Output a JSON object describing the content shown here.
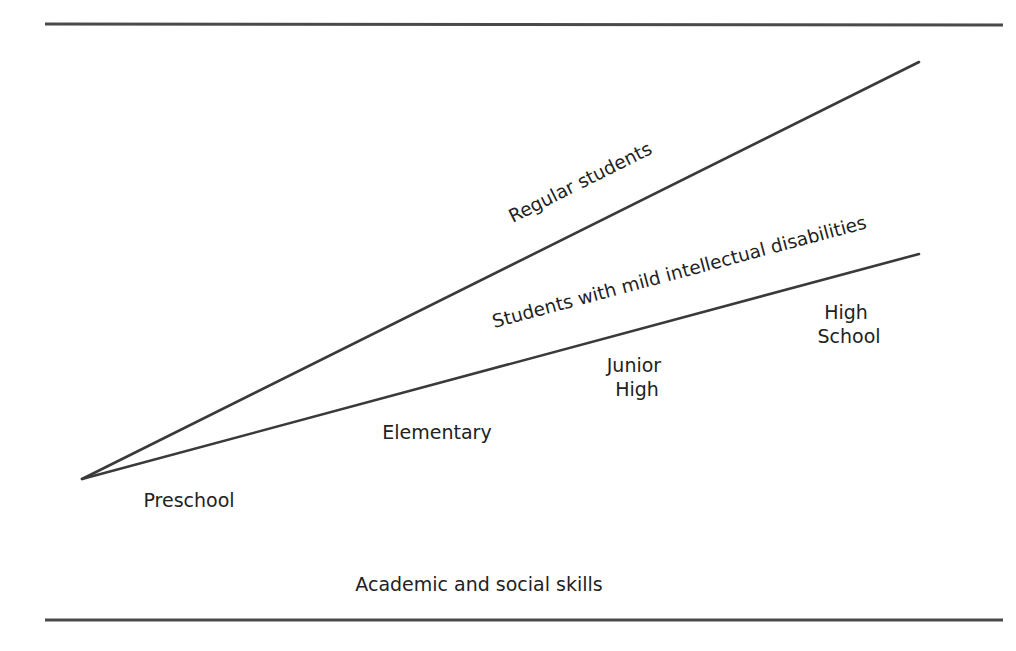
{
  "figure": {
    "rules": {
      "top": {
        "x1": 45,
        "y1": 24,
        "x2": 1003,
        "y2": 25
      },
      "bottom": {
        "x1": 45,
        "y1": 620,
        "x2": 1003,
        "y2": 620
      }
    },
    "lines": [
      {
        "id": "regular",
        "label": "Regular students",
        "x1": 82,
        "y1": 479,
        "x2": 919,
        "y2": 62
      },
      {
        "id": "mild",
        "label": "Students with mild intellectual disabilities",
        "x1": 82,
        "y1": 479,
        "x2": 919,
        "y2": 254
      }
    ],
    "line_labels": {
      "regular": {
        "text": "Regular students",
        "x": 583,
        "y": 188,
        "angle": -26.5
      },
      "mild": {
        "text": "Students with mild intellectual disabilities",
        "x": 681,
        "y": 278,
        "angle": -15.0
      }
    },
    "stages": {
      "preschool": {
        "lines": [
          "Preschool"
        ],
        "x": 189,
        "y": 507
      },
      "elementary": {
        "lines": [
          "Elementary"
        ],
        "x": 437,
        "y": 439
      },
      "junior_high": {
        "lines": [
          "Junior",
          "High"
        ],
        "x": 637,
        "y": 372
      },
      "high_school": {
        "lines": [
          "High",
          "School"
        ],
        "x": 849,
        "y": 319
      }
    },
    "axis_label": {
      "text": "Academic and social skills",
      "x": 479,
      "y": 591
    },
    "colors": {
      "line": "#3a3a3a",
      "rule": "#4a4a4a",
      "text": "#222222",
      "background": "#ffffff"
    }
  }
}
